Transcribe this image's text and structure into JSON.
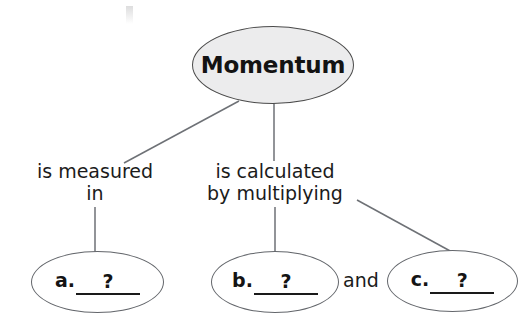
{
  "diagram": {
    "type": "concept-map",
    "root": {
      "label": "Momentum",
      "fill": "#ececed",
      "stroke": "#4a4a4a"
    },
    "branches": [
      {
        "id": "branch-measured",
        "edge_label": "is measured\nin",
        "target": "node-a"
      },
      {
        "id": "branch-calculated",
        "edge_label": "is calculated\nby multiplying",
        "targets": [
          "node-b",
          "node-c"
        ]
      }
    ],
    "conjunction": "and",
    "leaf_nodes": [
      {
        "id": "node-a",
        "letter": "a.",
        "blank": "?"
      },
      {
        "id": "node-b",
        "letter": "b.",
        "blank": "?"
      },
      {
        "id": "node-c",
        "letter": "c.",
        "blank": "?"
      }
    ],
    "colors": {
      "background": "#ffffff",
      "root_fill": "#ececed",
      "leaf_fill": "#ffffff",
      "outline": "#63666b",
      "text": "#141414",
      "connector": "#6e7176"
    }
  }
}
